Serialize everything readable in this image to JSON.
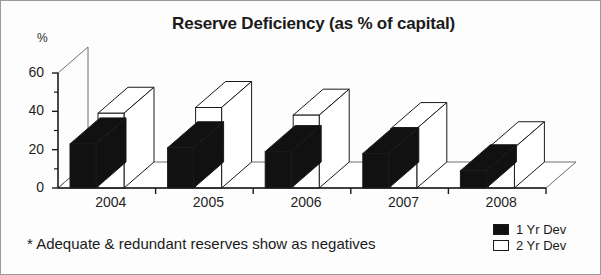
{
  "chart_data": {
    "type": "bar",
    "title": "Reserve Deficiency (as % of capital)",
    "xlabel": "",
    "ylabel": "%",
    "categories": [
      "2004",
      "2005",
      "2006",
      "2007",
      "2008"
    ],
    "series": [
      {
        "name": "1 Yr Dev",
        "color": "#111111",
        "values": [
          23,
          21,
          19,
          18,
          9
        ]
      },
      {
        "name": "2 Yr Dev",
        "color": "#ffffff",
        "values": [
          39,
          42,
          38,
          31,
          21
        ]
      }
    ],
    "ylim": [
      0,
      60
    ],
    "yticks": [
      0,
      20,
      40,
      60
    ],
    "yminorticks": [
      10,
      30,
      50
    ],
    "ytick_labels": [
      "0",
      "20",
      "40",
      "60"
    ],
    "grid": false,
    "legend_position": "bottom-right",
    "style": "3d-perspective-bars",
    "footnote": "* Adequate & redundant reserves show as negatives"
  },
  "axis": {
    "unit_label": "%"
  },
  "legend": {
    "items": [
      {
        "label": "1 Yr Dev",
        "swatch": "#111111"
      },
      {
        "label": "2 Yr Dev",
        "swatch": "#ffffff"
      }
    ]
  }
}
